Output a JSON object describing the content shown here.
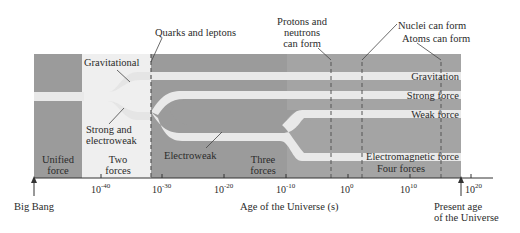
{
  "diagram": {
    "colors": {
      "region_dark": "#9b9b9b",
      "region_light": "#efefef",
      "region_four_forces": "#a4a4a4",
      "force_band": "#e9e9e9",
      "dashed_line": "#555555",
      "text": "#2b2b2b"
    },
    "eras": [
      {
        "label_line1": "Unified",
        "label_line2": "force"
      },
      {
        "label_line1": "Two",
        "label_line2": "forces"
      },
      {
        "label_line1": "Three",
        "label_line2": "forces"
      },
      {
        "label_line1": "Four forces",
        "label_line2": ""
      }
    ],
    "force_labels": {
      "gravitational": "Gravitational",
      "strong_and_electroweak_line1": "Strong and",
      "strong_and_electroweak_line2": "electroweak",
      "electroweak": "Electroweak",
      "gravitation": "Gravitation",
      "strong_force": "Strong force",
      "weak_force": "Weak force",
      "electromagnetic_force": "Electromagnetic force"
    },
    "milestones": [
      {
        "label_lines": [
          "Quarks and leptons"
        ]
      },
      {
        "label_lines": [
          "Protons and",
          "neutrons",
          "can form"
        ]
      },
      {
        "label_lines": [
          "Nuclei can form"
        ]
      },
      {
        "label_lines": [
          "Atoms can form"
        ]
      }
    ],
    "axis": {
      "label": "Age of the Universe (s)",
      "tick_base": "10",
      "ticks": [
        "-40",
        "-30",
        "-20",
        "-10",
        "0",
        "10",
        "20"
      ],
      "start_label": "Big Bang",
      "present_label_line1": "Present age",
      "present_label_line2": "of the Universe"
    }
  }
}
